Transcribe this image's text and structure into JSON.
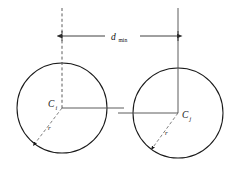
{
  "figure": {
    "type": "geometry-diagram",
    "background_color": "#ffffff",
    "stroke_color": "#1a1a1a",
    "axis_color": "#4a4a4a"
  },
  "labels": {
    "center_left": "C",
    "center_left_subscript": "i",
    "center_right": "C",
    "center_right_subscript": "j",
    "radius_left": "r",
    "radius_right": "r",
    "distance": "d",
    "distance_subscript": "min"
  },
  "geometry": {
    "circle_left": {
      "cx": 62,
      "cy": 108,
      "r": 45
    },
    "circle_right": {
      "cx": 178,
      "cy": 113,
      "r": 45
    },
    "dimension_line": {
      "y": 36,
      "x_start": 62,
      "x_end": 178
    },
    "vertical_left": {
      "x": 62,
      "y_top": 8,
      "y_bottom": 108,
      "style": "dashed"
    },
    "vertical_right": {
      "x": 178,
      "y_top": 8,
      "y_bottom": 113,
      "style": "solid"
    },
    "center_connector": {
      "x_start": 62,
      "x_end": 178,
      "y_left": 108,
      "y_right": 113
    },
    "radius_arrow_left": {
      "x1": 62,
      "y1": 108,
      "x2": 31,
      "y2": 148
    },
    "radius_arrow_right": {
      "x1": 178,
      "y1": 113,
      "x2": 149,
      "y2": 152
    }
  }
}
